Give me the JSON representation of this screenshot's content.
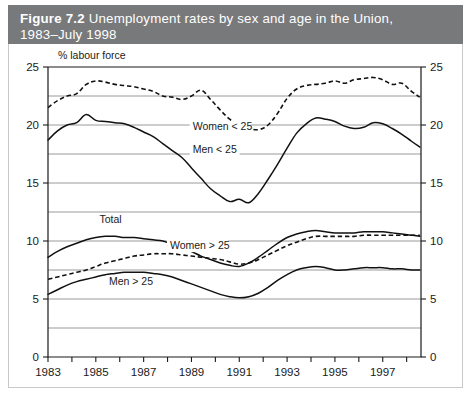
{
  "figure": {
    "number": "Figure 7.2",
    "title": "Unemployment rates by sex and age in the Union, 1983–July 1998",
    "title_line1_number": "Figure 7.2",
    "title_line1_text": "Unemployment rates by sex and age in the Union,",
    "title_line2_text": "1983–July 1998",
    "header_color": "#78797b"
  },
  "chart_data": {
    "type": "line",
    "title": "Unemployment rates by sex and age in the Union, 1983–July 1998",
    "xlabel": "",
    "ylabel": "% labour force",
    "ylabel_caption": "% labour force",
    "xlim": [
      1983,
      1998.6
    ],
    "ylim": [
      0,
      25
    ],
    "yticks": [
      0,
      5,
      10,
      15,
      20,
      25
    ],
    "ytick_labels": [
      "0",
      "5",
      "10",
      "15",
      "20",
      "25"
    ],
    "gridlines": [
      2.5,
      5,
      7.5,
      10,
      12.5,
      15,
      17.5,
      20,
      22.5
    ],
    "grid": true,
    "dual_y_axis": true,
    "xticks": [
      1983,
      1984,
      1985,
      1986,
      1987,
      1988,
      1989,
      1990,
      1991,
      1992,
      1993,
      1994,
      1995,
      1996,
      1997,
      1998
    ],
    "xtick_labels": [
      "1983",
      "",
      "1985",
      "",
      "1987",
      "",
      "1989",
      "",
      "1991",
      "",
      "1993",
      "",
      "1995",
      "",
      "1997",
      ""
    ],
    "xtick_labels_shown": [
      "1983",
      "1985",
      "1987",
      "1989",
      "1991",
      "1993",
      "1995",
      "1997"
    ],
    "legend": "inline-labels",
    "legend_position": "inline",
    "series": [
      {
        "name": "Women < 25",
        "label": "Women < 25",
        "style": "dashed",
        "label_x": 1989.05,
        "label_y": 19.55,
        "x": [
          1983.0,
          1983.4,
          1983.8,
          1984.2,
          1984.6,
          1985.0,
          1985.4,
          1985.8,
          1986.2,
          1986.6,
          1987.0,
          1987.4,
          1987.8,
          1988.2,
          1988.6,
          1989.0,
          1989.4,
          1989.8,
          1990.2,
          1990.6,
          1991.0,
          1991.4,
          1991.8,
          1992.2,
          1992.6,
          1993.0,
          1993.4,
          1993.8,
          1994.2,
          1994.6,
          1995.0,
          1995.4,
          1995.8,
          1996.2,
          1996.6,
          1997.0,
          1997.4,
          1997.8,
          1998.2,
          1998.55
        ],
        "y": [
          21.5,
          22.1,
          22.5,
          22.7,
          23.5,
          23.8,
          23.7,
          23.5,
          23.4,
          23.3,
          23.1,
          22.9,
          22.5,
          22.4,
          22.2,
          22.5,
          23.0,
          22.2,
          21.3,
          20.5,
          19.9,
          19.7,
          19.6,
          20.0,
          21.0,
          22.3,
          23.1,
          23.4,
          23.5,
          23.6,
          23.8,
          23.6,
          23.9,
          24.0,
          24.1,
          23.9,
          23.5,
          23.6,
          22.9,
          22.4
        ]
      },
      {
        "name": "Men < 25",
        "label": "Men < 25",
        "style": "solid",
        "label_x": 1989.05,
        "label_y": 17.6,
        "x": [
          1983.0,
          1983.4,
          1983.8,
          1984.2,
          1984.6,
          1985.0,
          1985.4,
          1985.8,
          1986.2,
          1986.6,
          1987.0,
          1987.4,
          1987.8,
          1988.2,
          1988.6,
          1989.0,
          1989.4,
          1989.8,
          1990.2,
          1990.6,
          1991.0,
          1991.4,
          1991.8,
          1992.2,
          1992.6,
          1993.0,
          1993.4,
          1993.8,
          1994.2,
          1994.6,
          1995.0,
          1995.4,
          1995.8,
          1996.2,
          1996.6,
          1997.0,
          1997.4,
          1997.8,
          1998.2,
          1998.55
        ],
        "y": [
          18.7,
          19.5,
          20.0,
          20.2,
          20.9,
          20.4,
          20.3,
          20.2,
          20.1,
          19.8,
          19.4,
          19.0,
          18.4,
          17.8,
          17.2,
          16.3,
          15.4,
          14.5,
          13.9,
          13.4,
          13.6,
          13.3,
          14.1,
          15.3,
          16.6,
          18.0,
          19.3,
          20.1,
          20.6,
          20.5,
          20.3,
          19.9,
          19.7,
          19.8,
          20.2,
          20.1,
          19.7,
          19.2,
          18.6,
          18.1
        ]
      },
      {
        "name": "Total",
        "label": "Total",
        "style": "solid",
        "label_x": 1985.15,
        "label_y": 11.55,
        "x": [
          1983.0,
          1983.4,
          1983.8,
          1984.2,
          1984.6,
          1985.0,
          1985.4,
          1985.8,
          1986.2,
          1986.6,
          1987.0,
          1987.4,
          1987.8,
          1988.2,
          1988.6,
          1989.0,
          1989.4,
          1989.8,
          1990.2,
          1990.6,
          1991.0,
          1991.4,
          1991.8,
          1992.2,
          1992.6,
          1993.0,
          1993.4,
          1993.8,
          1994.2,
          1994.6,
          1995.0,
          1995.4,
          1995.8,
          1996.2,
          1996.6,
          1997.0,
          1997.4,
          1997.8,
          1998.2,
          1998.55
        ],
        "y": [
          8.6,
          9.1,
          9.5,
          9.8,
          10.1,
          10.3,
          10.4,
          10.4,
          10.3,
          10.3,
          10.2,
          10.1,
          10.0,
          9.7,
          9.4,
          9.1,
          8.7,
          8.4,
          8.1,
          7.9,
          7.8,
          8.1,
          8.6,
          9.2,
          9.8,
          10.3,
          10.6,
          10.8,
          10.9,
          10.8,
          10.7,
          10.7,
          10.7,
          10.8,
          10.8,
          10.8,
          10.7,
          10.6,
          10.5,
          10.4
        ]
      },
      {
        "name": "Women > 25",
        "label": "Women > 25",
        "style": "dashed",
        "label_x": 1988.1,
        "label_y": 9.3,
        "x": [
          1983.0,
          1983.4,
          1983.8,
          1984.2,
          1984.6,
          1985.0,
          1985.4,
          1985.8,
          1986.2,
          1986.6,
          1987.0,
          1987.4,
          1987.8,
          1988.2,
          1988.6,
          1989.0,
          1989.4,
          1989.8,
          1990.2,
          1990.6,
          1991.0,
          1991.4,
          1991.8,
          1992.2,
          1992.6,
          1993.0,
          1993.4,
          1993.8,
          1994.2,
          1994.6,
          1995.0,
          1995.4,
          1995.8,
          1996.2,
          1996.6,
          1997.0,
          1997.4,
          1997.8,
          1998.2,
          1998.55
        ],
        "y": [
          6.7,
          6.9,
          7.1,
          7.3,
          7.5,
          7.8,
          8.1,
          8.3,
          8.5,
          8.7,
          8.8,
          8.9,
          8.9,
          8.9,
          8.8,
          8.7,
          8.6,
          8.5,
          8.4,
          8.2,
          8.0,
          8.1,
          8.4,
          8.8,
          9.2,
          9.6,
          9.9,
          10.2,
          10.4,
          10.4,
          10.4,
          10.4,
          10.4,
          10.5,
          10.5,
          10.5,
          10.5,
          10.5,
          10.5,
          10.5
        ]
      },
      {
        "name": "Men > 25",
        "label": "Men > 25",
        "style": "solid",
        "label_x": 1985.55,
        "label_y": 6.25,
        "x": [
          1983.0,
          1983.4,
          1983.8,
          1984.2,
          1984.6,
          1985.0,
          1985.4,
          1985.8,
          1986.2,
          1986.6,
          1987.0,
          1987.4,
          1987.8,
          1988.2,
          1988.6,
          1989.0,
          1989.4,
          1989.8,
          1990.2,
          1990.6,
          1991.0,
          1991.4,
          1991.8,
          1992.2,
          1992.6,
          1993.0,
          1993.4,
          1993.8,
          1994.2,
          1994.6,
          1995.0,
          1995.4,
          1995.8,
          1996.2,
          1996.6,
          1997.0,
          1997.4,
          1997.8,
          1998.2,
          1998.55
        ],
        "y": [
          5.4,
          5.8,
          6.2,
          6.5,
          6.7,
          6.9,
          7.1,
          7.2,
          7.3,
          7.3,
          7.3,
          7.2,
          7.1,
          6.9,
          6.6,
          6.3,
          6.0,
          5.7,
          5.4,
          5.2,
          5.1,
          5.2,
          5.5,
          6.0,
          6.6,
          7.1,
          7.5,
          7.7,
          7.8,
          7.7,
          7.5,
          7.5,
          7.6,
          7.7,
          7.7,
          7.7,
          7.6,
          7.6,
          7.5,
          7.5
        ]
      }
    ]
  }
}
